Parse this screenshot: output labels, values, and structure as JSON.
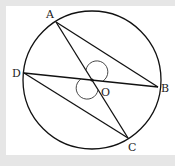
{
  "diagram": {
    "type": "circle-geometry",
    "circle": {
      "center_label": "O",
      "cx": 92,
      "cy": 80,
      "r": 69
    },
    "points": [
      {
        "name": "A",
        "x": 56,
        "y": 22,
        "label_x": 46,
        "label_y": 18
      },
      {
        "name": "B",
        "x": 158,
        "y": 87,
        "label_x": 161,
        "label_y": 92
      },
      {
        "name": "C",
        "x": 128,
        "y": 138,
        "label_x": 128,
        "label_y": 151
      },
      {
        "name": "D",
        "x": 24,
        "y": 73,
        "label_x": 12,
        "label_y": 77
      },
      {
        "name": "O",
        "x": 92,
        "y": 80,
        "label_x": 101,
        "label_y": 96
      }
    ],
    "segments": [
      "AC",
      "DB",
      "AB",
      "DC"
    ],
    "angle_marks": [
      "AOB",
      "DOC"
    ],
    "labels": {
      "A": "A",
      "B": "B",
      "C": "C",
      "D": "D",
      "O": "O"
    }
  },
  "colors": {
    "stroke": "#111111",
    "background": "#e6e6e6",
    "panel": "#ffffff"
  }
}
